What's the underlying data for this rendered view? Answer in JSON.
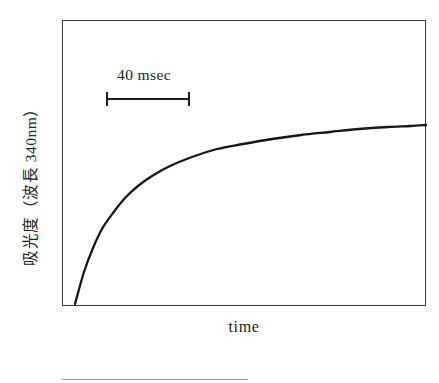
{
  "figure": {
    "axes": {
      "y_label": "吸光度（波長 340nm）",
      "x_label": "time"
    },
    "annotation": {
      "scale_label": "40 msec"
    },
    "colors": {
      "frame": "#3a3a3a",
      "curve": "#171717",
      "text": "#232323",
      "background": "#ffffff",
      "next_edge": "#8f8f8f"
    }
  },
  "chart_data": {
    "type": "line",
    "title": "",
    "subtitle": "",
    "xlabel": "time",
    "ylabel": "吸光度（波長 340nm）",
    "axis_ticks_shown": false,
    "grid": false,
    "legend": null,
    "xlim": [
      0,
      1
    ],
    "ylim": [
      0,
      1
    ],
    "annotations": [
      {
        "type": "scale-bar",
        "label": "40 msec",
        "orientation": "horizontal",
        "x_start": 0.121,
        "x_end": 0.349,
        "y": 0.724,
        "span_fraction_of_axis": 0.228
      }
    ],
    "series": [
      {
        "name": "absorbance",
        "description": "monotonic saturating (exponential-approach) rise in absorbance at 340 nm over time",
        "x": [
          0.036,
          0.06,
          0.085,
          0.11,
          0.14,
          0.173,
          0.21,
          0.25,
          0.3,
          0.36,
          0.43,
          0.5,
          0.58,
          0.66,
          0.74,
          0.82,
          0.9,
          0.96,
          1.0
        ],
        "y": [
          0.007,
          0.12,
          0.206,
          0.272,
          0.33,
          0.382,
          0.424,
          0.459,
          0.494,
          0.526,
          0.553,
          0.572,
          0.589,
          0.602,
          0.613,
          0.622,
          0.63,
          0.635,
          0.637
        ],
        "path_points_px": [
          [
            75,
            304
          ],
          [
            84,
            272
          ],
          [
            93,
            248
          ],
          [
            102,
            229
          ],
          [
            113,
            213
          ],
          [
            125,
            198
          ],
          [
            138,
            186
          ],
          [
            152,
            176
          ],
          [
            170,
            166
          ],
          [
            192,
            157
          ],
          [
            217,
            149
          ],
          [
            243,
            144
          ],
          [
            272,
            139
          ],
          [
            301,
            135
          ],
          [
            330,
            132
          ],
          [
            359,
            129
          ],
          [
            388,
            127
          ],
          [
            410,
            126
          ],
          [
            426,
            125
          ]
        ]
      }
    ]
  }
}
